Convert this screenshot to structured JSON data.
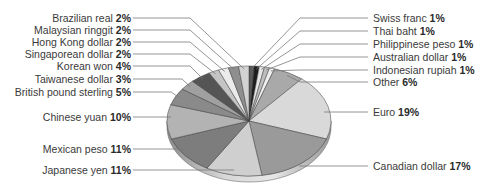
{
  "chart_data": {
    "type": "pie",
    "style": "3d-tilted",
    "title": "",
    "unit": "%",
    "legend": "none (leader-line labels)",
    "slices": [
      {
        "label": "Swiss franc",
        "value": 1,
        "color": "#5a5a5a",
        "side": "right",
        "label_y": 18
      },
      {
        "label": "Thai baht",
        "value": 1,
        "color": "#1e1e1e",
        "side": "right",
        "label_y": 31
      },
      {
        "label": "Philippinese peso",
        "value": 1,
        "color": "#e6e6e6",
        "side": "right",
        "label_y": 44
      },
      {
        "label": "Australian dollar",
        "value": 1,
        "color": "#bdbdbd",
        "side": "right",
        "label_y": 57
      },
      {
        "label": "Indonesian rupiah",
        "value": 1,
        "color": "#efefef",
        "side": "right",
        "label_y": 70
      },
      {
        "label": "Other",
        "value": 6,
        "color": "#a9a9a9",
        "side": "right",
        "label_y": 82
      },
      {
        "label": "Euro",
        "value": 19,
        "color": "#d9d9d9",
        "side": "right",
        "label_y": 112
      },
      {
        "label": "Canadian dollar",
        "value": 17,
        "color": "#9a9a9a",
        "side": "right",
        "label_y": 166
      },
      {
        "label": "Japanese yen",
        "value": 11,
        "color": "#cfcfcf",
        "side": "left",
        "label_y": 170
      },
      {
        "label": "Mexican peso",
        "value": 11,
        "color": "#7d7d7d",
        "side": "left",
        "label_y": 149
      },
      {
        "label": "Chinese yuan",
        "value": 10,
        "color": "#b3b3b3",
        "side": "left",
        "label_y": 117
      },
      {
        "label": "British pound sterling",
        "value": 5,
        "color": "#8a8a8a",
        "side": "left",
        "label_y": 92
      },
      {
        "label": "Taiwanese dollar",
        "value": 3,
        "color": "#a0a0a0",
        "side": "left",
        "label_y": 79
      },
      {
        "label": "Korean won",
        "value": 4,
        "color": "#555555",
        "side": "left",
        "label_y": 66
      },
      {
        "label": "Singaporean dollar",
        "value": 2,
        "color": "#c4c4c4",
        "side": "left",
        "label_y": 54
      },
      {
        "label": "Hong Kong dollar",
        "value": 2,
        "color": "#ebebeb",
        "side": "left",
        "label_y": 42
      },
      {
        "label": "Malaysian ringgit",
        "value": 2,
        "color": "#8f8f8f",
        "side": "left",
        "label_y": 30
      },
      {
        "label": "Brazilian real",
        "value": 2,
        "color": "#d2d2d2",
        "side": "left",
        "label_y": 18
      }
    ],
    "total": 100
  }
}
